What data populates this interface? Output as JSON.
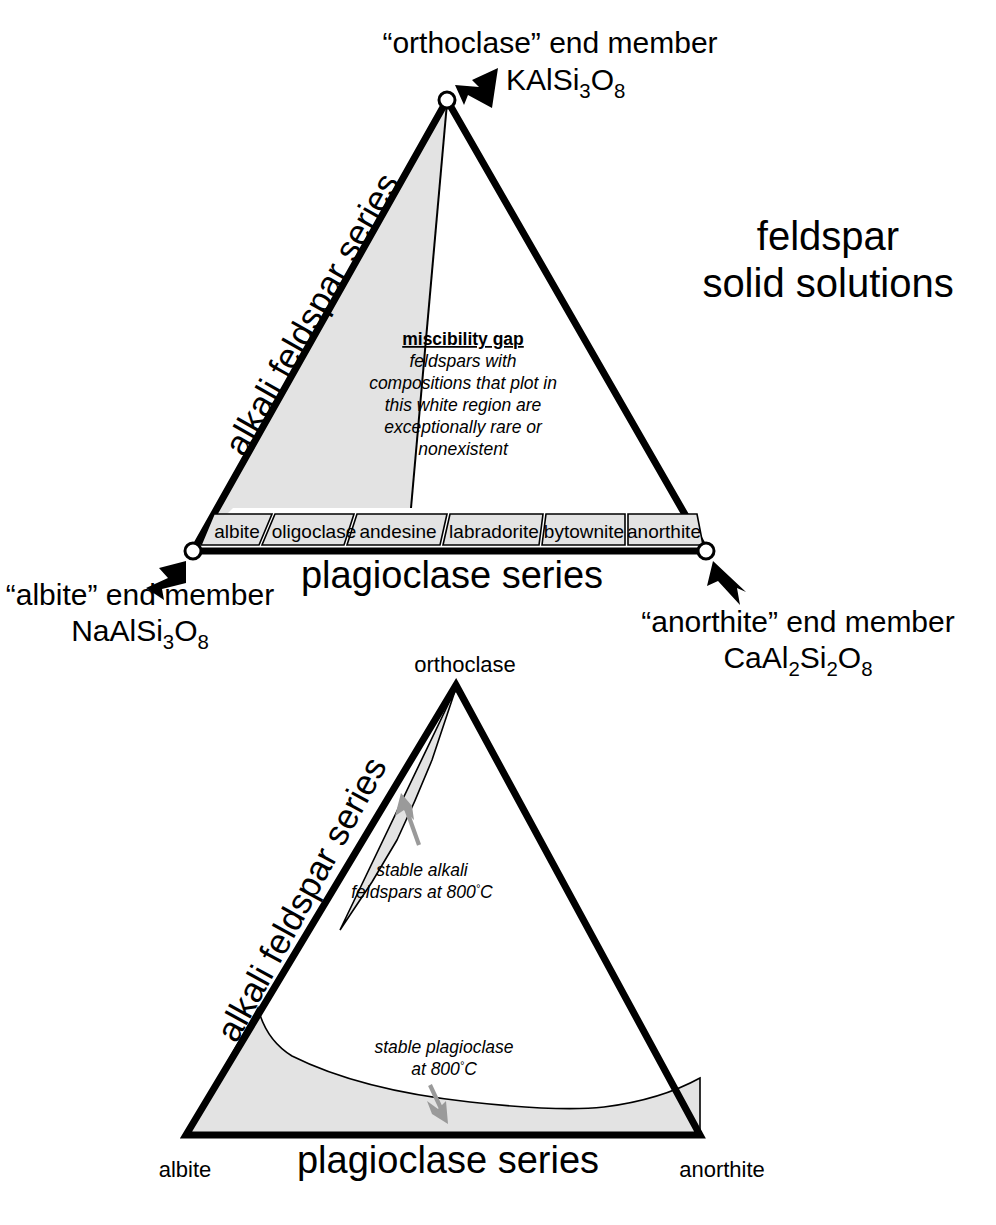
{
  "title": {
    "line1": "feldspar",
    "line2": "solid solutions"
  },
  "top_diagram": {
    "apex_label": {
      "line1": "“orthoclase” end member",
      "formula_main": "KAlSi",
      "formula_sub1": "3",
      "formula_mid": "O",
      "formula_sub2": "8"
    },
    "left_vertex_label": {
      "line1": "“albite” end member",
      "formula_main": "NaAlSi",
      "formula_sub1": "3",
      "formula_mid": "O",
      "formula_sub2": "8"
    },
    "right_vertex_label": {
      "line1": "“anorthite” end member",
      "formula_main": "CaAl",
      "formula_sub1": "2",
      "formula_mid": "Si",
      "formula_sub2": "2",
      "formula_mid2": "O",
      "formula_sub3": "8"
    },
    "left_edge_label": "alkali feldspar series",
    "bottom_edge_label": "plagioclase series",
    "miscibility": {
      "heading": "miscibility gap",
      "line1": "feldspars with",
      "line2": "compositions that plot in",
      "line3": "this white region are",
      "line4": "exceptionally rare or",
      "line5": "nonexistent"
    },
    "plagioclase_boxes": [
      "albite",
      "oligoclase",
      "andesine",
      "labradorite",
      "bytownite",
      "anorthite"
    ]
  },
  "bottom_diagram": {
    "apex_label": "orthoclase",
    "left_vertex_label": "albite",
    "right_vertex_label": "anorthite",
    "left_edge_label": "alkali feldspar series",
    "bottom_edge_label": "plagioclase series",
    "alkali_note": {
      "line1": "stable alkali",
      "line2": "feldspars at 800",
      "degree": "°",
      "unit": "C"
    },
    "plagioclase_note": {
      "line1": "stable plagioclase",
      "line2": "at 800",
      "degree": "°",
      "unit": "C"
    }
  },
  "colors": {
    "shade": "#e3e3e3",
    "outline": "#000000",
    "gray_arrow": "#9a9a9a"
  }
}
